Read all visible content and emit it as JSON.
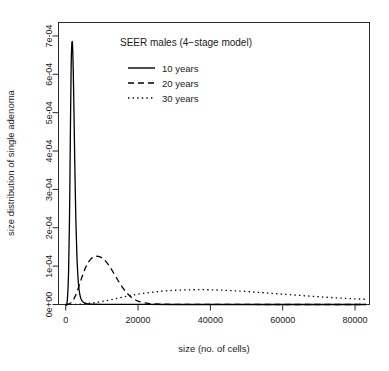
{
  "chart_data": {
    "type": "line",
    "title": "SEER males (4−stage model)",
    "xlabel": "size (no. of cells)",
    "ylabel": "size distribution of single adenoma",
    "xlim": [
      -2000,
      84000
    ],
    "ylim": [
      0,
      0.000735
    ],
    "grid": false,
    "legend_position": "top-center",
    "xticks": [
      0,
      20000,
      40000,
      60000,
      80000
    ],
    "xticklabels": [
      "0",
      "20000",
      "40000",
      "60000",
      "80000"
    ],
    "yticks": [
      0,
      0.0001,
      0.0002,
      0.0003,
      0.0004,
      0.0005,
      0.0006,
      0.0007
    ],
    "yticklabels": [
      "0e+00",
      "1e-04",
      "2e-04",
      "3e-04",
      "4e-04",
      "5e-04",
      "6e-04",
      "7e-04"
    ],
    "series": [
      {
        "name": "10 years",
        "linestyle": "solid",
        "color": "#000000",
        "peak_x": 1800,
        "peak_y": 0.000685,
        "x": [
          0,
          400,
          800,
          1100,
          1300,
          1500,
          1650,
          1800,
          1950,
          2100,
          2300,
          2500,
          2800,
          3100,
          3500,
          3900,
          4400,
          5000,
          5800,
          6800,
          8000,
          10000,
          13000,
          17000,
          22000,
          30000,
          40000,
          55000,
          70000,
          83000
        ],
        "y": [
          0.0,
          6e-06,
          9e-05,
          0.00027,
          0.00046,
          0.00062,
          0.000672,
          0.000685,
          0.00066,
          0.0006,
          0.00049,
          0.00037,
          0.00022,
          0.000125,
          5.6e-05,
          2.6e-05,
          1.1e-05,
          5e-06,
          2.2e-06,
          1.1e-06,
          6e-07,
          3e-07,
          2e-07,
          1e-07,
          1e-07,
          0.0,
          0.0,
          0.0,
          0.0,
          0.0
        ]
      },
      {
        "name": "20 years",
        "linestyle": "dashed",
        "color": "#000000",
        "peak_x": 9000,
        "peak_y": 0.0001255,
        "x": [
          0,
          1000,
          2000,
          3000,
          4000,
          5000,
          6000,
          7000,
          8000,
          9000,
          10000,
          11000,
          12000,
          13000,
          14000,
          15000,
          16000,
          17000,
          18000,
          19000,
          20000,
          22000,
          24000,
          27000,
          31000,
          36000,
          42000,
          50000,
          60000,
          70000,
          83000
        ],
        "y": [
          0.0,
          2e-06,
          1.1e-05,
          3e-05,
          5.8e-05,
          8.5e-05,
          0.000106,
          0.000119,
          0.0001245,
          0.0001255,
          0.0001215,
          0.000113,
          0.000101,
          8.6e-05,
          7e-05,
          5.45e-05,
          4.05e-05,
          2.9e-05,
          2e-05,
          1.35e-05,
          9e-06,
          4e-06,
          1.8e-06,
          8e-07,
          4e-07,
          2e-07,
          1e-07,
          1e-07,
          0.0,
          0.0,
          0.0
        ]
      },
      {
        "name": "30 years",
        "linestyle": "dotted",
        "color": "#000000",
        "peak_x": 40000,
        "peak_y": 3.85e-05,
        "x": [
          0,
          3000,
          6000,
          9000,
          12000,
          15000,
          18000,
          21000,
          24000,
          27000,
          30000,
          33000,
          36000,
          39000,
          42000,
          45000,
          48000,
          52000,
          56000,
          60000,
          64000,
          68000,
          72000,
          76000,
          80000,
          83000
        ],
        "y": [
          0.0,
          5e-07,
          2.5e-06,
          6e-06,
          1.15e-05,
          1.75e-05,
          2.35e-05,
          2.85e-05,
          3.2e-05,
          3.5e-05,
          3.7e-05,
          3.8e-05,
          3.85e-05,
          3.85e-05,
          3.78e-05,
          3.66e-05,
          3.5e-05,
          3.25e-05,
          2.98e-05,
          2.7e-05,
          2.42e-05,
          2.15e-05,
          1.9e-05,
          1.68e-05,
          1.48e-05,
          1.35e-05
        ]
      }
    ],
    "annotations": [
      {
        "text": "SEER males (4−stage model)",
        "x_px": 186,
        "y_px": 46
      }
    ]
  },
  "legend": {
    "entries": [
      {
        "label": "10 years",
        "style": "solid"
      },
      {
        "label": "20 years",
        "style": "dashed"
      },
      {
        "label": "30 years",
        "style": "dotted"
      }
    ]
  }
}
